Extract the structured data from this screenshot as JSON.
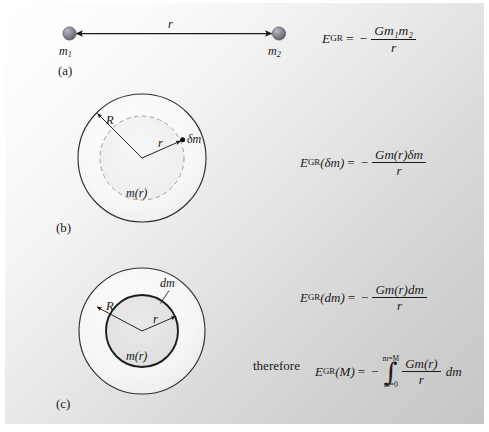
{
  "figure": {
    "background": {
      "light_corner": "#ffffff",
      "dark_corner": "#c6c6c6"
    },
    "panels": [
      {
        "id": "a",
        "label": "(a)",
        "description": "Two point masses separated by distance r with a double-headed arrow between them",
        "sphere_color": "#8a8a93",
        "labels": {
          "left_mass": "m",
          "left_mass_sub": "1",
          "right_mass": "m",
          "right_mass_sub": "2",
          "separation": "r"
        },
        "equation": {
          "lhs": "E",
          "lhs_sub": "GR",
          "equals": "=",
          "sign": "−",
          "numerator": "Gm₁m₂",
          "denominator": "r",
          "plain": "E_GR = − Gm₁m₂ / r"
        }
      },
      {
        "id": "b",
        "label": "(b)",
        "description": "Sphere of radius R containing a dashed interior sphere of radius r enclosing mass m(r), with a small element δm on the dashed surface",
        "outer_radius_label": "R",
        "inner_radius_label": "r",
        "enclosed_mass_label": "m(r)",
        "element_label": "δm",
        "outer_stroke": "#2a2a2a",
        "inner_stroke_dashed": "#9a9a9a",
        "equation": {
          "lhs": "E",
          "lhs_sub": "GR",
          "lhs_arg": "(δm)",
          "equals": "=",
          "sign": "−",
          "numerator": "Gm(r)δm",
          "denominator": "r",
          "plain": "E_GR(δm) = − Gm(r)δm / r"
        }
      },
      {
        "id": "c",
        "label": "(c)",
        "description": "Sphere of radius R with a solid interior sphere of radius r of mass m(r) and an infinitesimal shell dm at its surface",
        "outer_radius_label": "R",
        "inner_radius_label": "r",
        "enclosed_mass_label": "m(r)",
        "element_label": "dm",
        "outer_stroke": "#2a2a2a",
        "inner_stroke": "#1a1a1a",
        "equation": {
          "lhs": "E",
          "lhs_sub": "GR",
          "lhs_arg": "(dm)",
          "equals": "=",
          "sign": "−",
          "numerator": "Gm(r)dm",
          "denominator": "r",
          "plain": "E_GR(dm) = − Gm(r)dm / r"
        },
        "result": {
          "connector": "therefore",
          "lhs": "E",
          "lhs_sub": "GR",
          "lhs_arg": "(M)",
          "equals": "=",
          "sign": "−",
          "integral_upper": "m=M",
          "integral_lower": "m=0",
          "numerator": "Gm(r)",
          "denominator": "r",
          "differential": "dm",
          "plain": "E_GR(M) = − ∫[m=0 to m=M] (Gm(r)/r) dm"
        }
      }
    ]
  }
}
